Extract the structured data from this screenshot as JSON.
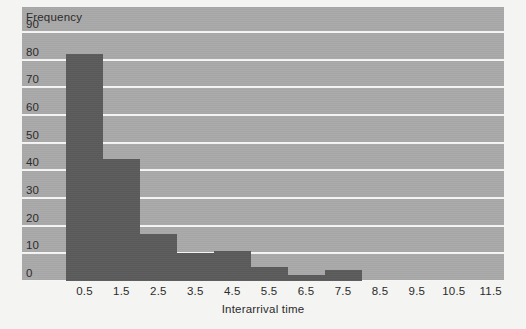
{
  "chart_data": {
    "type": "bar",
    "title": "",
    "subtitle": "",
    "xlabel": "Interarrival time",
    "ylabel": "Frequency",
    "categories": [
      "0.5",
      "1.5",
      "2.5",
      "3.5",
      "4.5",
      "5.5",
      "6.5",
      "7.5",
      "8.5",
      "9.5",
      "10.5",
      "11.5"
    ],
    "values": [
      82,
      44,
      17,
      10,
      11,
      5,
      2,
      4,
      0,
      0,
      0,
      0
    ],
    "ytick_labels": [
      "0",
      "10",
      "20",
      "30",
      "40",
      "50",
      "60",
      "70",
      "80",
      "90"
    ],
    "ytick_values": [
      0,
      10,
      20,
      30,
      40,
      50,
      60,
      70,
      80,
      90
    ],
    "ylim": [
      0,
      99
    ],
    "xlim": [
      0,
      12
    ],
    "grid": "horizontal",
    "legend": "none",
    "series": [
      {
        "name": "Frequency",
        "values": [
          82,
          44,
          17,
          10,
          11,
          5,
          2,
          4,
          0,
          0,
          0,
          0
        ]
      }
    ]
  },
  "style": {
    "plot_background": "#a9a9a9",
    "bar_color": "#5b5b5b",
    "gridline_color": "#f6f6f4",
    "page_background": "#f4f4f2",
    "text_color": "#2b2b2b"
  }
}
